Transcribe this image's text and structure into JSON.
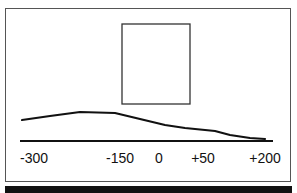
{
  "figure": {
    "elements": {
      "rectangle": {
        "x": 122,
        "y": 24,
        "width": 68,
        "height": 80
      },
      "curve_points": [
        [
          22,
          120
        ],
        [
          50,
          116
        ],
        [
          80,
          112
        ],
        [
          115,
          113
        ],
        [
          140,
          119
        ],
        [
          165,
          125
        ],
        [
          185,
          128
        ],
        [
          215,
          131
        ],
        [
          230,
          135
        ],
        [
          250,
          138
        ],
        [
          265,
          139
        ]
      ],
      "baseline": {
        "x1": 20,
        "x2": 273,
        "y": 141
      }
    },
    "axis_labels": [
      {
        "text": "-300",
        "x": 34
      },
      {
        "text": "-150",
        "x": 120
      },
      {
        "text": "0",
        "x": 159
      },
      {
        "text": "+50",
        "x": 203
      },
      {
        "text": "+200",
        "x": 265
      }
    ],
    "caption": "",
    "colors": {
      "line": "#111111",
      "frame": "#555555",
      "caption_bg": "#111111"
    }
  }
}
